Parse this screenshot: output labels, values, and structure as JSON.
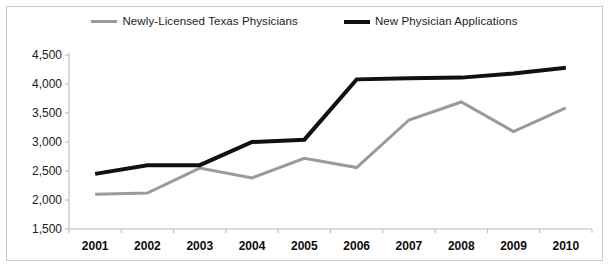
{
  "legend": {
    "position": "top-center",
    "entries": [
      {
        "label": "Newly-Licensed Texas Physicians",
        "color": "#9a9a9a",
        "icon": "line-swatch-icon"
      },
      {
        "label": "New Physician Applications",
        "color": "#111111",
        "icon": "line-swatch-icon"
      }
    ]
  },
  "axes": {
    "y_ticks": [
      "4,500",
      "4,000",
      "3,500",
      "3,000",
      "2,500",
      "2,000",
      "1,500"
    ],
    "x_ticks": [
      "2001",
      "2002",
      "2003",
      "2004",
      "2005",
      "2006",
      "2007",
      "2008",
      "2009",
      "2010"
    ]
  },
  "chart_data": {
    "type": "line",
    "title": "",
    "subtitle": "",
    "xlabel": "",
    "ylabel": "",
    "categories": [
      "2001",
      "2002",
      "2003",
      "2004",
      "2005",
      "2006",
      "2007",
      "2008",
      "2009",
      "2010"
    ],
    "x": [
      2001,
      2002,
      2003,
      2004,
      2005,
      2006,
      2007,
      2008,
      2009,
      2010
    ],
    "series": [
      {
        "name": "Newly-Licensed Texas Physicians",
        "color": "#9a9a9a",
        "width": 3,
        "values": [
          2100,
          2120,
          2550,
          2380,
          2720,
          2560,
          3380,
          3690,
          3180,
          3590
        ]
      },
      {
        "name": "New Physician Applications",
        "color": "#111111",
        "width": 4,
        "values": [
          2450,
          2600,
          2600,
          3000,
          3040,
          4080,
          4100,
          4110,
          4180,
          4280
        ]
      }
    ],
    "ylim": [
      1500,
      4500
    ],
    "ytick_step": 500,
    "grid": false,
    "legend_position": "top-center",
    "colors": {
      "axis": "#b6b6b6",
      "border": "#c9c9c9",
      "text": "#1c1c1c",
      "background": "#ffffff"
    }
  }
}
